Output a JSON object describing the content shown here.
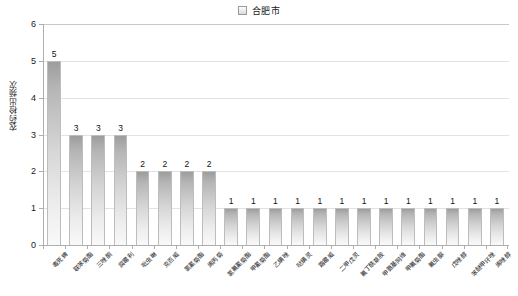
{
  "legend": {
    "position": "top-center",
    "entries": [
      {
        "label": "合肥市",
        "swatch_color": "#d9d9d9"
      }
    ]
  },
  "axis": {
    "ylabel": "农药检出频次",
    "xlabel": "",
    "yticks": [
      "0",
      "1",
      "2",
      "3",
      "4",
      "5",
      "6"
    ]
  },
  "chart_data": {
    "type": "bar",
    "title": "",
    "subtitle": "",
    "xlabel": "",
    "ylabel": "农药检出频次",
    "ylim": [
      0,
      6
    ],
    "ytick_step": 1,
    "grid": true,
    "grid_axis": "y",
    "legend_position": "top-center",
    "series_name": "合肥市",
    "bar_color": "#d0d0d0",
    "bar_edge_color": "#bdbdbd",
    "data_labels": true,
    "categories": [
      "毒死蜱",
      "联苯菊酯",
      "三唑酮",
      "腐霉利",
      "吡虫啉",
      "克百威",
      "氯氰菊酯",
      "烯丙菊",
      "氯氟氰菊酯",
      "甲氰菊酯",
      "乙螨唑",
      "哒螨灵",
      "霜霉威",
      "二甲戊灵",
      "氟丁酰草胺",
      "甲氨基阿维",
      "甲氟菊酯",
      "氟虫脲",
      "戊唑醇",
      "苯醚甲环唑",
      "烯唑醇"
    ],
    "values": [
      5,
      3,
      3,
      3,
      2,
      2,
      2,
      2,
      1,
      1,
      1,
      1,
      1,
      1,
      1,
      1,
      1,
      1,
      1,
      1,
      1
    ]
  }
}
